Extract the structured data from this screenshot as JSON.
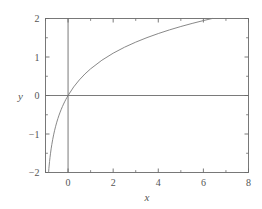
{
  "figure": {
    "background_color": "#ffffff",
    "frame_color": "#6b6b6b",
    "curve_color": "#7a7a7a",
    "text_color": "#555555"
  },
  "chart_data": {
    "type": "line",
    "title": "",
    "subtitle": "",
    "xlabel": "x",
    "ylabel": "y",
    "xlim": [
      -1,
      8
    ],
    "ylim": [
      -2,
      2
    ],
    "grid": false,
    "legend": null,
    "x_ticks": [
      0,
      2,
      4,
      6,
      8
    ],
    "x_tick_labels": [
      "0",
      "2",
      "4",
      "6",
      "8"
    ],
    "x_minor_ticks": [
      -1,
      1,
      3,
      5,
      7
    ],
    "y_ticks": [
      -2,
      -1,
      0,
      1,
      2
    ],
    "y_tick_labels": [
      "-2",
      "-1",
      "0",
      "1",
      "2"
    ],
    "y_minor_ticks": [
      -1.5,
      -0.5,
      0.5,
      1.5
    ],
    "axis_lines": {
      "x_axis_at_y": 0,
      "y_axis_at_x": 0
    },
    "series": [
      {
        "name": "y = ln(1 + x)",
        "expression": "ln(1+x)",
        "x": [
          -0.865,
          -0.86,
          -0.85,
          -0.84,
          -0.82,
          -0.8,
          -0.78,
          -0.75,
          -0.72,
          -0.68,
          -0.64,
          -0.6,
          -0.55,
          -0.5,
          -0.45,
          -0.4,
          -0.35,
          -0.3,
          -0.25,
          -0.2,
          -0.15,
          -0.1,
          -0.05,
          0,
          0.25,
          0.5,
          0.75,
          1,
          1.5,
          2,
          2.5,
          3,
          3.5,
          4,
          4.5,
          5,
          5.5,
          6,
          6.389,
          7,
          8
        ],
        "y": [
          -2.0,
          -1.966,
          -1.897,
          -1.833,
          -1.715,
          -1.609,
          -1.514,
          -1.386,
          -1.273,
          -1.139,
          -1.022,
          -0.916,
          -0.799,
          -0.693,
          -0.598,
          -0.511,
          -0.431,
          -0.357,
          -0.288,
          -0.223,
          -0.163,
          -0.105,
          -0.051,
          0.0,
          0.223,
          0.405,
          0.56,
          0.693,
          0.916,
          1.099,
          1.253,
          1.386,
          1.504,
          1.609,
          1.705,
          1.792,
          1.872,
          1.946,
          2.0,
          2.079,
          2.197
        ]
      }
    ]
  }
}
